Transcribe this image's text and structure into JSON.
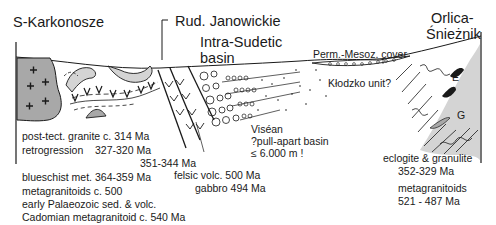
{
  "diagram": {
    "type": "geological-cross-section",
    "regions": {
      "left": "S-Karkonosze",
      "center_top": "Rud. Janowickie",
      "basin": [
        "Intra-Sudetic",
        "basin"
      ],
      "right": [
        "Orlica-",
        "Śnieżnik"
      ]
    },
    "labels": {
      "cover": "Perm.-Mesoz. cover",
      "klodzko": "Kłodzko unit?",
      "eclogite_marker": "E",
      "granulite_marker": "G",
      "visean": [
        "Viséan",
        "?pull-apart basin",
        "≤ 6.000 m !"
      ]
    },
    "left_legend": [
      {
        "text": "post-tect. granite c. 314 Ma"
      },
      {
        "text": "retrogression    327-320 Ma"
      },
      {
        "text": "351-344 Ma"
      },
      {
        "text": "blueschist met. 364-359 Ma"
      },
      {
        "text": "metagranitoids c. 500"
      },
      {
        "text": "early Palaeozoic sed. & volc."
      },
      {
        "text": "Cadomian metagranitoid c. 540 Ma"
      }
    ],
    "center_legend": [
      "felsic volc. 500 Ma",
      "gabbro 494 Ma"
    ],
    "right_legend": [
      "eclogite & granulite",
      "352-329 Ma",
      "metagranitoids",
      "521 - 487 Ma"
    ],
    "colors": {
      "granite_fill": "#a8a8a8",
      "light_fill": "#d4d4d4",
      "line": "#1a1a1a"
    }
  }
}
